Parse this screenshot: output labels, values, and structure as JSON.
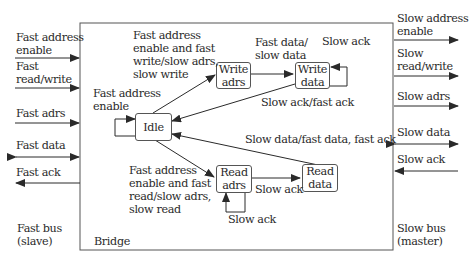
{
  "diagram": {
    "container_label": "Bridge",
    "fast_bus": {
      "label": "Fast bus\n(slave)",
      "signals": [
        {
          "name": "Fast address\nenable",
          "direction": "in"
        },
        {
          "name": "Fast\nread/write",
          "direction": "in"
        },
        {
          "name": "Fast adrs",
          "direction": "in"
        },
        {
          "name": "Fast data",
          "direction": "bidirectional"
        },
        {
          "name": "Fast ack",
          "direction": "out"
        }
      ]
    },
    "slow_bus": {
      "label": "Slow bus\n(master)",
      "signals": [
        {
          "name": "Slow address\nenable",
          "direction": "out"
        },
        {
          "name": "Slow\nread/write",
          "direction": "out"
        },
        {
          "name": "Slow adrs",
          "direction": "out"
        },
        {
          "name": "Slow data",
          "direction": "bidirectional"
        },
        {
          "name": "Slow ack",
          "direction": "in"
        }
      ]
    },
    "states": {
      "idle": "Idle",
      "write_adrs": "Write\nadrs",
      "write_data": "Write\ndata",
      "read_adrs": "Read\nadrs",
      "read_data": "Read\ndata"
    },
    "transitions": {
      "idle_self": "Fast address\nenable",
      "idle_to_write_adrs": "Fast address\nenable and fast\nwrite/slow adrs,\nslow write",
      "write_adrs_to_write_data": "Fast data/\nslow data",
      "write_data_self": "Slow ack",
      "write_data_to_idle": "Slow ack/fast ack",
      "idle_to_read_adrs": "Fast address\nenable and fast\nread/slow adrs,\nslow read",
      "read_adrs_self": "Slow ack",
      "read_adrs_to_read_data": "Slow ack",
      "read_data_to_idle": "Slow data/fast data, fast ack"
    }
  }
}
